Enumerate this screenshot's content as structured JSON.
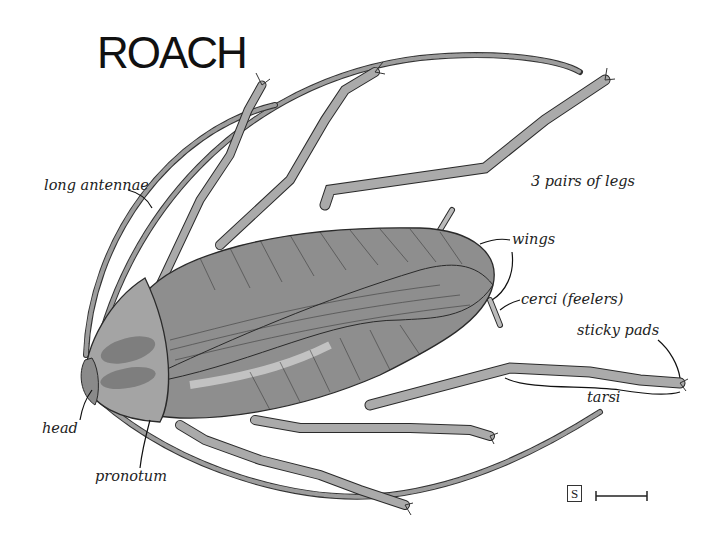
{
  "diagram": {
    "title": "ROACH",
    "labels": {
      "long_antennae": "long antennae",
      "three_pairs_of_legs": "3 pairs of legs",
      "wings": "wings",
      "cerci": "cerci  (feelers)",
      "sticky_pads": "sticky pads",
      "tarsi": "tarsi",
      "head": "head",
      "pronotum": "pronotum"
    },
    "scale": {
      "symbol": "S"
    },
    "colors": {
      "body_fill": "#8e8e8e",
      "body_light": "#c4c4c4",
      "leg_fill": "#a9a9a9",
      "outline": "#2a2a2a"
    }
  }
}
